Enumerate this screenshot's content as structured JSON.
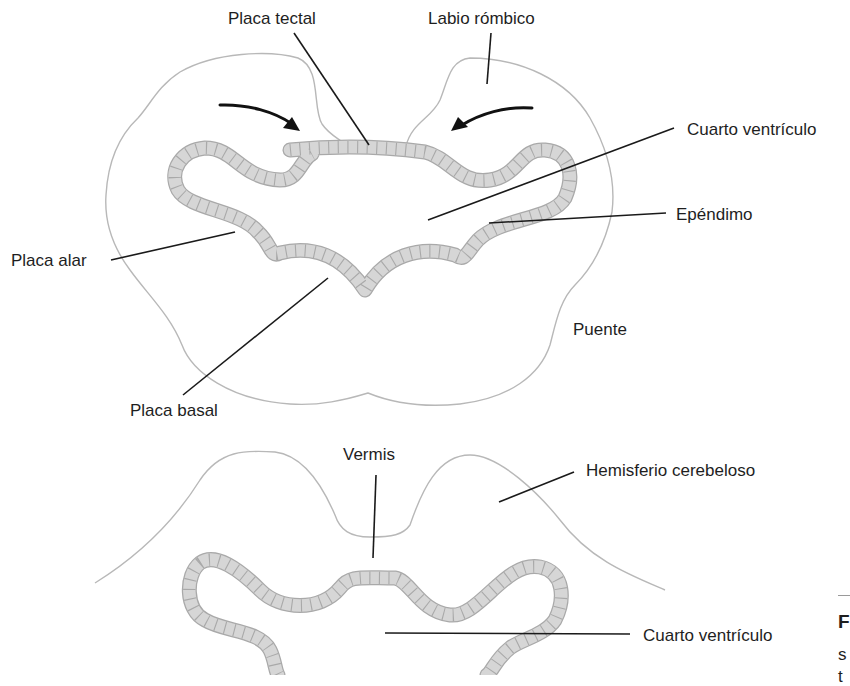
{
  "diagram": {
    "upper_section": {
      "labels": [
        {
          "id": "placa-tectal",
          "text": "Placa tectal",
          "x": 228,
          "y": 10,
          "line": [
            294,
            33,
            369,
            145
          ]
        },
        {
          "id": "labio-rombico",
          "text": "Labio rómbico",
          "x": 428,
          "y": 10,
          "line": [
            491,
            33,
            487,
            84
          ]
        },
        {
          "id": "cuarto-ventriculo-upper",
          "text": "Cuarto ventrículo",
          "x": 687,
          "y": 121,
          "line": [
            674,
            128,
            428,
            220
          ]
        },
        {
          "id": "ependimo",
          "text": "Epéndimo",
          "x": 676,
          "y": 206,
          "line": [
            666,
            213,
            489,
            223
          ]
        },
        {
          "id": "placa-alar",
          "text": "Placa alar",
          "x": 11,
          "y": 252,
          "line": [
            111,
            260,
            235,
            232
          ]
        },
        {
          "id": "placa-basal",
          "text": "Placa basal",
          "x": 130,
          "y": 402,
          "line": [
            183,
            395,
            328,
            278
          ]
        },
        {
          "id": "puente",
          "text": "Puente",
          "x": 573,
          "y": 321,
          "line": null
        }
      ]
    },
    "lower_section": {
      "labels": [
        {
          "id": "vermis",
          "text": "Vermis",
          "x": 343,
          "y": 446,
          "line": [
            376,
            475,
            373,
            558
          ]
        },
        {
          "id": "hemisferio-cerebeloso",
          "text": "Hemisferio cerebeloso",
          "x": 586,
          "y": 462,
          "line": [
            574,
            472,
            499,
            502
          ]
        },
        {
          "id": "cuarto-ventriculo-lower",
          "text": "Cuarto ventrículo",
          "x": 643,
          "y": 627,
          "line": [
            630,
            634,
            385,
            633
          ]
        }
      ]
    },
    "caption": {
      "figure_prefix": "F",
      "text_fragment": "s",
      "text_fragment2": "t"
    }
  }
}
